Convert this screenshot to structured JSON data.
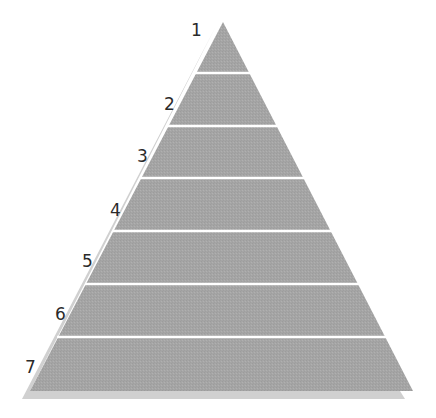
{
  "diagram": {
    "type": "pyramid",
    "levels": 7,
    "labels": [
      "1",
      "2",
      "3",
      "4",
      "5",
      "6",
      "7"
    ],
    "colors": {
      "fill": "#a6a6a6",
      "shadow": "#d2d2d2",
      "divider": "#ffffff",
      "label": "#2a2a2a"
    }
  }
}
